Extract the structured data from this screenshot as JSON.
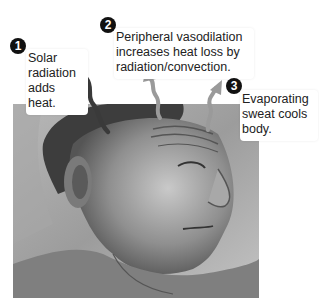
{
  "figure": {
    "callouts": [
      {
        "number": "1",
        "text_lines": [
          "Solar",
          "radiation",
          "adds heat."
        ]
      },
      {
        "number": "2",
        "text_lines": [
          "Peripheral vasodilation",
          "increases heat loss by",
          "radiation/convection."
        ]
      },
      {
        "number": "3",
        "text_lines": [
          "Evaporating",
          "sweat cools",
          "body."
        ]
      }
    ],
    "arrows": [
      {
        "name": "solar-radiation-arrow",
        "direction": "down",
        "color": "#3a3a3a"
      },
      {
        "name": "vasodilation-heat-loss-arrow",
        "direction": "up",
        "color": "#9a9a9a"
      },
      {
        "name": "evaporation-arrow",
        "direction": "up",
        "color": "#9a9a9a"
      }
    ]
  }
}
